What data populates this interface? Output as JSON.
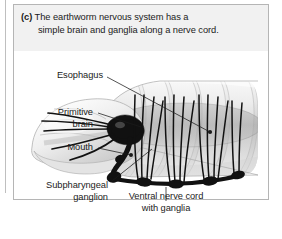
{
  "panel": {
    "caption": {
      "tag": "(c)",
      "line1": "The earthworm nervous system has a",
      "line2": "simple brain and ganglia along a nerve cord."
    }
  },
  "figure": {
    "alt": "earthworm-nervous-system-diagram",
    "labels": {
      "esophagus": "Esophagus",
      "primitive_brain_line1": "Primitive",
      "primitive_brain_line2": "brain",
      "mouth": "Mouth",
      "subpharyngeal_line1": "Subpharyngeal",
      "subpharyngeal_line2": "ganglion",
      "ventral_line1": "Ventral nerve cord",
      "ventral_line2": "with ganglia"
    },
    "colors": {
      "panel_border": "#b5b5b5",
      "caption_background": "#f1f1f1",
      "text": "#1b1b1b",
      "nerve": "#111111",
      "body_light": "#f2f2f2",
      "body_mid": "#c9c9c9",
      "body_shadow": "#9a9a9a"
    }
  }
}
